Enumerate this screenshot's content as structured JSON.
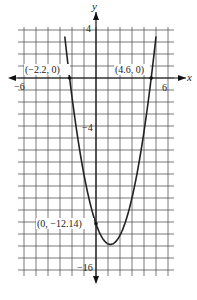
{
  "chart_data": {
    "type": "line",
    "title": "",
    "xlabel": "x",
    "ylabel": "y",
    "xlim": [
      -6.5,
      6.5
    ],
    "ylim": [
      -16.5,
      4.25
    ],
    "grid": true,
    "x_tick_labels": [
      {
        "value": -6,
        "label": "-6"
      },
      {
        "value": 6,
        "label": "6"
      }
    ],
    "y_tick_labels": [
      {
        "value": 4,
        "label": "4"
      },
      {
        "value": -4,
        "label": "-4"
      },
      {
        "value": -16,
        "label": "-16"
      }
    ],
    "series": [
      {
        "name": "parabola",
        "equation": "y = 1.2(x + 2.2)(x - 4.6)",
        "vertex": [
          1.2,
          -13.87
        ],
        "x": [
          -3.0,
          -2.2,
          -1.0,
          0.0,
          1.2,
          2.0,
          3.0,
          4.6,
          5.5
        ],
        "values": [
          4.5,
          0,
          -8.06,
          -12.14,
          -13.87,
          -13.1,
          -10.18,
          0,
          7.02
        ]
      }
    ],
    "annotations": [
      {
        "point": [
          -2.2,
          0
        ],
        "label": "(−2.2, 0)"
      },
      {
        "point": [
          4.6,
          0
        ],
        "label": "(4.6, 0)"
      },
      {
        "point": [
          0,
          -12.14
        ],
        "label": "(0, −12.14)"
      }
    ]
  },
  "labels": {
    "x_axis": "x",
    "y_axis": "y",
    "tick_4": "4",
    "tick_neg4": "−4",
    "tick_neg16": "−16",
    "tick_neg6": "−6",
    "tick_6": "6",
    "root_left": "(−2.2, 0)",
    "root_right": "(4.6, 0)",
    "y_intercept": "(0, −12.14)"
  }
}
